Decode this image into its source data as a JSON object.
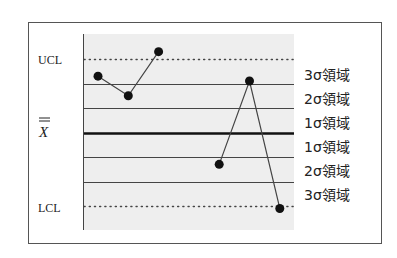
{
  "chart_data": {
    "type": "line",
    "title": "",
    "subtitle": "Control chart (X-bar chart) with sigma zones",
    "xlabel": "",
    "ylabel": "",
    "y_axis_labels": [
      {
        "label": "UCL",
        "position": "+3σ"
      },
      {
        "label": "X̿",
        "position": "center line"
      },
      {
        "label": "LCL",
        "position": "-3σ"
      }
    ],
    "zone_labels": [
      "3σ領域",
      "2σ領域",
      "1σ領域",
      "1σ領域",
      "2σ領域",
      "3σ領域"
    ],
    "ylim_sigma": [
      -3.9,
      3.9
    ],
    "reference_lines": [
      {
        "sigma": 3,
        "style": "dotted",
        "name": "UCL"
      },
      {
        "sigma": 2,
        "style": "solid-thin"
      },
      {
        "sigma": 1,
        "style": "solid-thin"
      },
      {
        "sigma": 0,
        "style": "solid-thick",
        "name": "center"
      },
      {
        "sigma": -1,
        "style": "solid-thin"
      },
      {
        "sigma": -2,
        "style": "solid-thin"
      },
      {
        "sigma": -3,
        "style": "dotted",
        "name": "LCL"
      }
    ],
    "series": [
      {
        "name": "segment-1",
        "x": [
          1,
          2,
          3
        ],
        "values": [
          2.3,
          1.5,
          3.3
        ]
      },
      {
        "name": "segment-2",
        "x": [
          5,
          6,
          7
        ],
        "values": [
          -1.3,
          2.1,
          -3.1
        ]
      }
    ],
    "grid": false,
    "legend": "none",
    "colors": {
      "plot_background": "#eeeeee",
      "frame": "#555555",
      "lines": "#444444",
      "center_line": "#111111",
      "points": "#111111",
      "text": "#222222"
    }
  },
  "labels": {
    "ucl": "UCL",
    "xbar": "X",
    "lcl": "LCL",
    "zones": [
      "3σ領域",
      "2σ領域",
      "1σ領域",
      "1σ領域",
      "2σ領域",
      "3σ領域"
    ]
  }
}
